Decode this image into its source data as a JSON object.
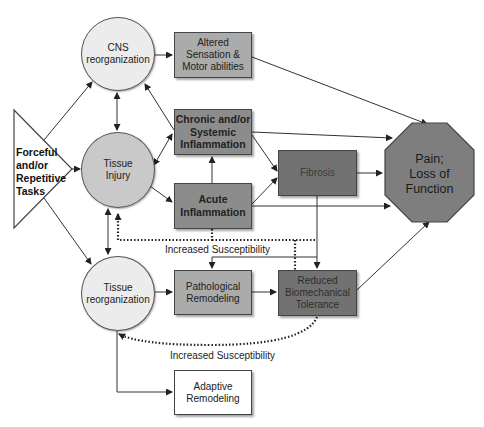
{
  "diagram": {
    "nodes": {
      "forceful_tasks": {
        "label_lines": [
          "Forceful",
          "and/or",
          "Repetitive",
          "Tasks"
        ],
        "shape": "triangle",
        "color": "#ffffff"
      },
      "cns_reorganization": {
        "label_lines": [
          "CNS",
          "reorganization"
        ],
        "shape": "circle",
        "color": "#ececec"
      },
      "tissue_injury": {
        "label_lines": [
          "Tissue",
          "Injury"
        ],
        "shape": "circle",
        "color": "#c9c9c9"
      },
      "tissue_reorganization": {
        "label_lines": [
          "Tissue",
          "reorganization"
        ],
        "shape": "circle",
        "color": "#ececec"
      },
      "altered_sensation": {
        "label_lines": [
          "Altered",
          "Sensation &",
          "Motor abilities"
        ],
        "shape": "box",
        "color": "#ababab"
      },
      "chronic_inflammation": {
        "label_lines": [
          "Chronic and/or",
          "Systemic",
          "Inflammation"
        ],
        "shape": "box",
        "color": "#8c8c8c"
      },
      "acute_inflammation": {
        "label_lines": [
          "Acute",
          "Inflammation"
        ],
        "shape": "box",
        "color": "#8c8c8c"
      },
      "fibrosis": {
        "label_lines": [
          "Fibrosis"
        ],
        "shape": "box",
        "color": "#727272"
      },
      "pathological_remodeling": {
        "label_lines": [
          "Pathological",
          "Remodeling"
        ],
        "shape": "box",
        "color": "#ababab"
      },
      "reduced_tolerance": {
        "label_lines": [
          "Reduced",
          "Biomechanical",
          "Tolerance"
        ],
        "shape": "box",
        "color": "#727272"
      },
      "adaptive_remodeling": {
        "label_lines": [
          "Adaptive",
          "Remodeling"
        ],
        "shape": "box",
        "color": "#ffffff"
      },
      "pain": {
        "label_lines": [
          "Pain;",
          "Loss of",
          "Function"
        ],
        "shape": "octagon",
        "color": "#7e7e7e"
      }
    },
    "annotations": {
      "upper_susceptibility": "Increased Susceptibility",
      "lower_susceptibility": "Increased Susceptibility"
    },
    "edges": [
      {
        "from": "forceful_tasks",
        "to": "cns_reorganization",
        "style": "solid"
      },
      {
        "from": "forceful_tasks",
        "to": "tissue_injury",
        "style": "solid"
      },
      {
        "from": "forceful_tasks",
        "to": "tissue_reorganization",
        "style": "solid"
      },
      {
        "from": "cns_reorganization",
        "to": "tissue_injury",
        "style": "solid",
        "bidirectional": true
      },
      {
        "from": "tissue_injury",
        "to": "tissue_reorganization",
        "style": "solid",
        "bidirectional": true
      },
      {
        "from": "cns_reorganization",
        "to": "altered_sensation",
        "style": "solid"
      },
      {
        "from": "chronic_inflammation",
        "to": "cns_reorganization",
        "style": "solid"
      },
      {
        "from": "tissue_injury",
        "to": "chronic_inflammation",
        "style": "solid",
        "bidirectional": true
      },
      {
        "from": "tissue_injury",
        "to": "acute_inflammation",
        "style": "solid"
      },
      {
        "from": "acute_inflammation",
        "to": "chronic_inflammation",
        "style": "solid"
      },
      {
        "from": "chronic_inflammation",
        "to": "fibrosis",
        "style": "solid"
      },
      {
        "from": "acute_inflammation",
        "to": "fibrosis",
        "style": "solid"
      },
      {
        "from": "altered_sensation",
        "to": "pain",
        "style": "solid"
      },
      {
        "from": "chronic_inflammation",
        "to": "pain",
        "style": "solid"
      },
      {
        "from": "fibrosis",
        "to": "pain",
        "style": "solid"
      },
      {
        "from": "acute_inflammation",
        "to": "pain",
        "style": "solid"
      },
      {
        "from": "fibrosis",
        "to": "reduced_tolerance",
        "style": "solid"
      },
      {
        "from": "fibrosis",
        "to": "pathological_remodeling",
        "style": "solid"
      },
      {
        "from": "tissue_reorganization",
        "to": "pathological_remodeling",
        "style": "solid"
      },
      {
        "from": "pathological_remodeling",
        "to": "reduced_tolerance",
        "style": "solid"
      },
      {
        "from": "reduced_tolerance",
        "to": "pain",
        "style": "solid"
      },
      {
        "from": "tissue_reorganization",
        "to": "adaptive_remodeling",
        "style": "solid"
      },
      {
        "from": "acute_inflammation",
        "to": "tissue_injury",
        "style": "dotted",
        "label": "Increased Susceptibility"
      },
      {
        "from": "reduced_tolerance",
        "to": "tissue_injury",
        "style": "dotted"
      },
      {
        "from": "reduced_tolerance",
        "to": "tissue_reorganization",
        "style": "dotted",
        "label": "Increased Susceptibility"
      }
    ]
  }
}
